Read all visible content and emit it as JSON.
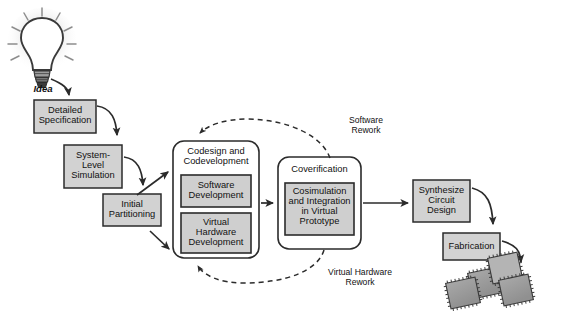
{
  "diagram": {
    "idea_label": "Idea",
    "colors": {
      "box_fill": "#d2d2d2",
      "inner_box_fill": "#cfcfcf",
      "group_fill": "#ffffff",
      "stroke": "#2b2b2b",
      "chip_fill": "#9b9b9b",
      "chip_top_fill": "#b4b4b4",
      "text": "#111111",
      "background": "#ffffff"
    },
    "nodes": [
      {
        "id": "detailed-specification",
        "label": "Detailed\nSpecification",
        "x": 34,
        "y": 100,
        "w": 62,
        "h": 33,
        "shape": "rect"
      },
      {
        "id": "system-level-simulation",
        "label": "System-\nLevel\nSimulation",
        "x": 64,
        "y": 145,
        "w": 58,
        "h": 43,
        "shape": "rect"
      },
      {
        "id": "initial-partitioning",
        "label": "Initial\nPartitioning",
        "x": 103,
        "y": 194,
        "w": 58,
        "h": 32,
        "shape": "rect"
      },
      {
        "id": "codesign-and-codevelopment",
        "label": "Codesign and\nCodevelopment",
        "x": 173,
        "y": 141,
        "w": 86,
        "h": 117,
        "shape": "rounded-group"
      },
      {
        "id": "software-development",
        "label": "Software\nDevelopment",
        "x": 181,
        "y": 175,
        "w": 70,
        "h": 32,
        "shape": "rect"
      },
      {
        "id": "virtual-hardware-development",
        "label": "Virtual\nHardware\nDevelopment",
        "x": 181,
        "y": 213,
        "w": 70,
        "h": 40,
        "shape": "rect"
      },
      {
        "id": "coverification",
        "label": "Coverification",
        "x": 278,
        "y": 157,
        "w": 83,
        "h": 92,
        "shape": "rounded-group"
      },
      {
        "id": "cosimulation-and-integration",
        "label": "Cosimulation\nand Integration\nin Virtual\nPrototype",
        "x": 285,
        "y": 183,
        "w": 69,
        "h": 52,
        "shape": "rect"
      },
      {
        "id": "synthesize-circuit-design",
        "label": "Synthesize\nCircuit\nDesign",
        "x": 413,
        "y": 180,
        "w": 57,
        "h": 42,
        "shape": "rect"
      },
      {
        "id": "fabrication",
        "label": "Fabrication",
        "x": 443,
        "y": 233,
        "w": 57,
        "h": 27,
        "shape": "rect"
      }
    ],
    "loop_labels": [
      {
        "id": "software-rework",
        "label": "Software\nRework",
        "x": 330,
        "y": 116,
        "w": 72
      },
      {
        "id": "virtual-hardware-rework",
        "label": "Virtual Hardware\nRework",
        "x": 305,
        "y": 268,
        "w": 110
      }
    ],
    "edges": [
      {
        "id": "idea-to-detailed-specification",
        "from": "idea",
        "to": "detailed-specification",
        "style": "solid"
      },
      {
        "id": "detailed-specification-to-system-level-simulation",
        "from": "detailed-specification",
        "to": "system-level-simulation",
        "style": "solid"
      },
      {
        "id": "system-level-simulation-to-initial-partitioning",
        "from": "system-level-simulation",
        "to": "initial-partitioning",
        "style": "solid"
      },
      {
        "id": "system-level-simulation-to-codesign",
        "from": "system-level-simulation",
        "to": "codesign-and-codevelopment",
        "style": "solid"
      },
      {
        "id": "initial-partitioning-to-codesign",
        "from": "initial-partitioning",
        "to": "codesign-and-codevelopment",
        "style": "solid"
      },
      {
        "id": "codesign-to-coverification",
        "from": "codesign-and-codevelopment",
        "to": "coverification",
        "style": "solid"
      },
      {
        "id": "coverification-to-synthesize",
        "from": "coverification",
        "to": "synthesize-circuit-design",
        "style": "solid"
      },
      {
        "id": "synthesize-to-fabrication",
        "from": "synthesize-circuit-design",
        "to": "fabrication",
        "style": "solid"
      },
      {
        "id": "fabrication-to-chips",
        "from": "fabrication",
        "to": "chips",
        "style": "solid"
      },
      {
        "id": "software-rework-feedback",
        "from": "coverification",
        "to": "codesign-and-codevelopment",
        "style": "dashed"
      },
      {
        "id": "virtual-hardware-rework-feedback",
        "from": "coverification",
        "to": "codesign-and-codevelopment",
        "style": "dashed"
      }
    ],
    "chips": [
      {
        "id": "chip-1",
        "cx": 485,
        "cy": 283,
        "size": 28,
        "rot": -12
      },
      {
        "id": "chip-2",
        "cx": 510,
        "cy": 292,
        "size": 28,
        "rot": -12
      },
      {
        "id": "chip-3",
        "cx": 505,
        "cy": 270,
        "size": 28,
        "rot": -12
      },
      {
        "id": "chip-4",
        "cx": 532,
        "cy": 281,
        "size": 28,
        "rot": -12
      }
    ]
  }
}
